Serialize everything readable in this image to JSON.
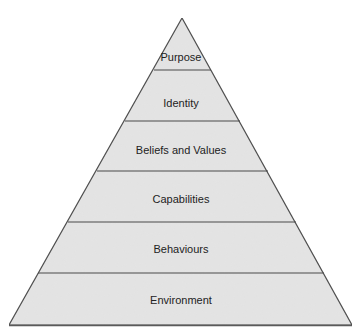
{
  "diagram": {
    "type": "pyramid",
    "orientation": "apex-up",
    "colors": {
      "fill": "#e4e4e4",
      "stroke": "#4a4a4a",
      "text": "#222222",
      "background": "#ffffff"
    },
    "layers_top_to_bottom": [
      {
        "label": "Purpose"
      },
      {
        "label": "Identity"
      },
      {
        "label": "Beliefs and Values"
      },
      {
        "label": "Capabilities"
      },
      {
        "label": "Behaviours"
      },
      {
        "label": "Environment"
      }
    ]
  }
}
